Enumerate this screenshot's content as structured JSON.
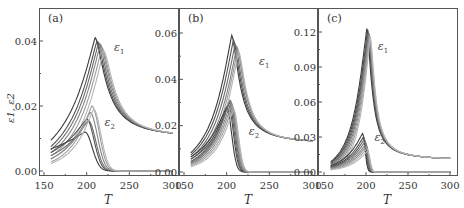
{
  "figure": {
    "ylabel": "ε1, ε2",
    "xlabel": "T"
  },
  "chart_data": [
    {
      "type": "line",
      "panel": "(a)",
      "xlabel": "T",
      "ylabel": "ε1, ε2",
      "xlim": [
        150,
        300
      ],
      "ylim": [
        0,
        0.044
      ],
      "xticks": [
        150,
        200,
        250,
        300
      ],
      "xtick_labels": [
        "150",
        "200",
        "250",
        "300"
      ],
      "yticks": [
        0.0,
        0.02,
        0.04
      ],
      "ytick_labels": [
        "0.00",
        "0.02",
        "0.04"
      ],
      "annotations": [
        {
          "text": "ε1",
          "x": 232,
          "y": 0.037
        },
        {
          "text": "ε2",
          "x": 221,
          "y": 0.014
        }
      ],
      "series_groups": [
        {
          "name": "ε1",
          "count": 6,
          "peak_T": [
            210,
            212,
            214,
            216,
            218,
            220
          ],
          "peak_value": [
            0.041,
            0.04,
            0.0395,
            0.039,
            0.038,
            0.037
          ],
          "tail_value_at_300": 0.01,
          "start_value_at_160": [
            0.01,
            0.008,
            0.007,
            0.006,
            0.005,
            0.004
          ]
        },
        {
          "name": "ε2",
          "count": 6,
          "peak_T": [
            198,
            200,
            202,
            204,
            206,
            208
          ],
          "peak_value": [
            0.012,
            0.016,
            0.0155,
            0.018,
            0.02,
            0.019
          ],
          "tail_value_at_300": 0.0,
          "start_value_at_160": [
            0.007,
            0.006,
            0.005,
            0.004,
            0.003,
            0.0025
          ]
        }
      ]
    },
    {
      "type": "line",
      "panel": "(b)",
      "xlabel": "T",
      "ylabel": "",
      "xlim": [
        150,
        300
      ],
      "ylim": [
        0,
        0.066
      ],
      "xticks": [
        150,
        200,
        250,
        300
      ],
      "xtick_labels": [
        "150",
        "200",
        "250",
        "300"
      ],
      "yticks": [
        0.0,
        0.02,
        0.04,
        0.06
      ],
      "ytick_labels": [
        "0.00",
        "0.02",
        "0.04",
        "0.06"
      ],
      "annotations": [
        {
          "text": "ε1",
          "x": 238,
          "y": 0.046
        },
        {
          "text": "ε2",
          "x": 226,
          "y": 0.016
        }
      ],
      "series_groups": [
        {
          "name": "ε1",
          "count": 6,
          "peak_T": [
            206,
            208,
            210,
            212,
            213,
            214
          ],
          "peak_value": [
            0.059,
            0.057,
            0.055,
            0.054,
            0.053,
            0.052
          ],
          "tail_value_at_300": 0.012,
          "start_value_at_160": [
            0.009,
            0.008,
            0.007,
            0.006,
            0.005,
            0.004
          ]
        },
        {
          "name": "ε2",
          "count": 8,
          "peak_T": [
            200,
            202,
            203,
            204,
            205,
            206,
            207,
            208
          ],
          "peak_value": [
            0.028,
            0.029,
            0.03,
            0.031,
            0.03,
            0.029,
            0.028,
            0.027
          ],
          "tail_value_at_300": 0.0,
          "start_value_at_160": [
            0.007,
            0.006,
            0.005,
            0.0045,
            0.004,
            0.0035,
            0.003,
            0.0025
          ]
        }
      ]
    },
    {
      "type": "line",
      "panel": "(c)",
      "xlabel": "T",
      "ylabel": "",
      "xlim": [
        150,
        300
      ],
      "ylim": [
        0,
        0.132
      ],
      "xticks": [
        150,
        200,
        250,
        300
      ],
      "xtick_labels": [
        "150",
        "200",
        "250",
        "300"
      ],
      "yticks": [
        0.0,
        0.03,
        0.06,
        0.09,
        0.12
      ],
      "ytick_labels": [
        "0.00",
        "0.03",
        "0.06",
        "0.09",
        "0.12"
      ],
      "annotations": [
        {
          "text": "ε1",
          "x": 214,
          "y": 0.105
        },
        {
          "text": "ε2",
          "x": 210,
          "y": 0.027
        }
      ],
      "series_groups": [
        {
          "name": "ε1",
          "count": 8,
          "peak_T": [
            201,
            202,
            202.5,
            203,
            203.5,
            204,
            204.5,
            205
          ],
          "peak_value": [
            0.123,
            0.122,
            0.121,
            0.12,
            0.119,
            0.118,
            0.117,
            0.116
          ],
          "tail_value_at_300": 0.01,
          "start_value_at_160": [
            0.01,
            0.009,
            0.008,
            0.007,
            0.006,
            0.005,
            0.004,
            0.003
          ]
        },
        {
          "name": "ε2",
          "count": 8,
          "peak_T": [
            196,
            197,
            198,
            199,
            200,
            200.5,
            201,
            202
          ],
          "peak_value": [
            0.033,
            0.03,
            0.028,
            0.026,
            0.024,
            0.022,
            0.02,
            0.018
          ],
          "tail_value_at_300": 0.0,
          "start_value_at_160": [
            0.006,
            0.005,
            0.0045,
            0.004,
            0.0035,
            0.003,
            0.0025,
            0.002
          ]
        }
      ]
    }
  ],
  "layout": {
    "panels_px": [
      {
        "left": 39,
        "right": 179,
        "top": 8,
        "bottom": 176,
        "x0": 44,
        "x1": 172,
        "y0": 171,
        "y1": 41,
        "yv1": 0.04
      },
      {
        "left": 179,
        "right": 318,
        "top": 8,
        "bottom": 176,
        "x0": 184,
        "x1": 312,
        "y0": 172,
        "y1": 33,
        "yv1": 0.06
      },
      {
        "left": 318,
        "right": 458,
        "top": 8,
        "bottom": 176,
        "x0": 324,
        "x1": 450,
        "y0": 172,
        "y1": 32,
        "yv1": 0.12
      }
    ],
    "colors": {
      "frame": "#555555",
      "curve_dark": "#3a3a3a",
      "curve_light": "#b4b4b4",
      "text": "#333333"
    }
  }
}
